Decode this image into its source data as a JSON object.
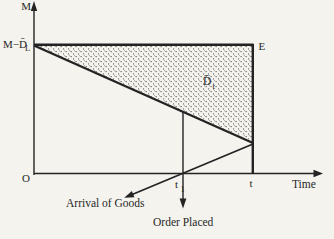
{
  "colors": {
    "background": "#f4f3ee",
    "ink": "#232323",
    "stipple_dot": "#3c3c3c"
  },
  "figure": {
    "y_axis_label": "M",
    "x_axis_label": "Time",
    "origin_label": "O",
    "upper_level_label": {
      "main": "M−D̄",
      "sub": "L"
    },
    "corner_label": "E",
    "region_label": {
      "main": "D̄",
      "sub": "t"
    },
    "review_time_label": {
      "main": "t",
      "sub": "1"
    },
    "cycle_end_label": "t",
    "annotations": {
      "arrival": "Arrival of Goods",
      "order": "Order Placed"
    }
  }
}
